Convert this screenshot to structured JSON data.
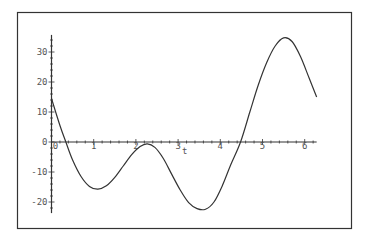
{
  "chart_data": {
    "type": "line",
    "title": "",
    "xlabel": "t",
    "ylabel": "",
    "xlim": [
      0,
      6.2832
    ],
    "ylim": [
      -23.7,
      35.7
    ],
    "x_ticks": [
      0,
      1,
      2,
      3,
      4,
      5,
      6
    ],
    "x_tick_labels": [
      "0",
      "1",
      "2",
      "3",
      "4",
      "5",
      "6"
    ],
    "y_ticks": [
      -20,
      -10,
      0,
      10,
      20,
      30
    ],
    "y_tick_labels": [
      "-20",
      "-10",
      "0",
      "10",
      "20",
      "30"
    ],
    "grid": false,
    "legend": "none",
    "series": [
      {
        "name": "f(t)",
        "color": "#333333",
        "x": [
          0,
          0.2,
          0.34,
          0.5,
          0.7,
          0.9,
          1.1,
          1.3,
          1.5,
          1.7,
          1.9,
          2.1,
          2.27,
          2.45,
          2.65,
          2.85,
          3.05,
          3.25,
          3.45,
          3.65,
          3.85,
          4.05,
          4.25,
          4.48,
          4.7,
          4.9,
          5.1,
          5.3,
          5.5,
          5.7,
          5.9,
          6.1,
          6.2832
        ],
        "y": [
          14.5,
          5.5,
          0,
          -6,
          -11.5,
          -14.8,
          -15.7,
          -14.6,
          -11.8,
          -8,
          -4.2,
          -1.5,
          -0.6,
          -1.8,
          -5.5,
          -10.8,
          -16,
          -20.2,
          -22.2,
          -22.4,
          -20,
          -14.5,
          -7.5,
          0,
          10,
          19,
          26.5,
          32,
          34.7,
          33.5,
          28.5,
          21.5,
          15
        ]
      }
    ]
  }
}
